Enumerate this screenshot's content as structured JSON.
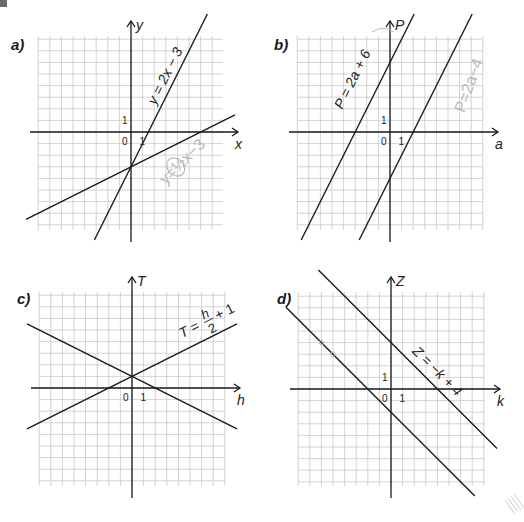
{
  "page": {
    "colors": {
      "grid": "#c8c8c8",
      "axis": "#1a1a1a",
      "line": "#1a1a1a",
      "pencil": "#b8b8b8"
    }
  },
  "panels": [
    {
      "id": "a",
      "label": "a)",
      "x_axis_label": "x",
      "y_axis_label": "y",
      "origin_label": "0",
      "x_unit_label": "1",
      "y_unit_label": "1",
      "origin_px": [
        131,
        132
      ],
      "grid_px": {
        "left": 38,
        "top": 36,
        "right": 223,
        "bottom": 230
      },
      "equation_label": "y = 2x − 3",
      "pencil_note": "y=½x−3",
      "lines": [
        {
          "name": "y = 2x − 3",
          "slope": 2,
          "intercept": -3,
          "labeled": true
        },
        {
          "name": "y = x/2 − 3",
          "slope": 0.5,
          "intercept": -3,
          "labeled": false
        }
      ]
    },
    {
      "id": "b",
      "label": "b)",
      "x_axis_label": "a",
      "y_axis_label": "P",
      "origin_label": "0",
      "x_unit_label": "1",
      "y_unit_label": "1",
      "origin_px": [
        390,
        132
      ],
      "grid_px": {
        "left": 297,
        "top": 36,
        "right": 483,
        "bottom": 230
      },
      "equation_label": "P = 2a + 6",
      "pencil_note": "P=2a−4",
      "lines": [
        {
          "name": "P = 2a + 6",
          "slope": 2,
          "intercept": 6,
          "labeled": true
        },
        {
          "name": "P = 2a − 4",
          "slope": 2,
          "intercept": -4,
          "labeled": false
        }
      ]
    },
    {
      "id": "c",
      "label": "c)",
      "x_axis_label": "h",
      "y_axis_label": "T",
      "origin_label": "0",
      "x_unit_label": "1",
      "y_unit_label": "",
      "origin_px": [
        132,
        388
      ],
      "grid_px": {
        "left": 39,
        "top": 292,
        "right": 225,
        "bottom": 486
      },
      "equation_label": "T = h/2 + 1",
      "lines": [
        {
          "name": "T = h/2 + 1",
          "slope": 0.5,
          "intercept": 1,
          "labeled": true
        },
        {
          "name": "T = −h/2 + 1",
          "slope": -0.5,
          "intercept": 1,
          "labeled": false
        }
      ]
    },
    {
      "id": "d",
      "label": "d)",
      "x_axis_label": "k",
      "y_axis_label": "Z",
      "origin_label": "0",
      "x_unit_label": "1",
      "y_unit_label": "1",
      "origin_px": [
        391,
        389
      ],
      "grid_px": {
        "left": 298,
        "top": 292,
        "right": 485,
        "bottom": 486
      },
      "equation_label": "Z = −k + 4",
      "lines": [
        {
          "name": "Z = −k + 4",
          "slope": -1,
          "intercept": 4,
          "labeled": true
        },
        {
          "name": "Z = −k − 2",
          "slope": -1,
          "intercept": -2,
          "labeled": false
        }
      ]
    }
  ],
  "cell_px": 11.6,
  "chart_data": [
    {
      "type": "line",
      "title": "a)",
      "xlabel": "x",
      "ylabel": "y",
      "grid": true,
      "xlim": [
        -8,
        8
      ],
      "ylim": [
        -8,
        8
      ],
      "series": [
        {
          "name": "y = 2x − 3",
          "x": [
            -2.5,
            5
          ],
          "values": [
            -8,
            7
          ]
        },
        {
          "name": "y = x/2 − 3",
          "x": [
            -8,
            8
          ],
          "values": [
            -7,
            1
          ]
        }
      ]
    },
    {
      "type": "line",
      "title": "b)",
      "xlabel": "a",
      "ylabel": "P",
      "grid": true,
      "xlim": [
        -8,
        8
      ],
      "ylim": [
        -8,
        8
      ],
      "series": [
        {
          "name": "P = 2a + 6",
          "x": [
            -7,
            1.3
          ],
          "values": [
            -8,
            8.6
          ]
        },
        {
          "name": "P = 2a − 4",
          "x": [
            -2,
            6
          ],
          "values": [
            -8,
            8
          ]
        }
      ]
    },
    {
      "type": "line",
      "title": "c)",
      "xlabel": "h",
      "ylabel": "T",
      "grid": true,
      "xlim": [
        -8,
        8
      ],
      "ylim": [
        -8,
        8
      ],
      "series": [
        {
          "name": "T = h/2 + 1",
          "x": [
            -8,
            8
          ],
          "values": [
            -3,
            5
          ]
        },
        {
          "name": "T = −h/2 + 1",
          "x": [
            -8,
            8
          ],
          "values": [
            5,
            -3
          ]
        }
      ]
    },
    {
      "type": "line",
      "title": "d)",
      "xlabel": "k",
      "ylabel": "Z",
      "grid": true,
      "xlim": [
        -8,
        8
      ],
      "ylim": [
        -8,
        8
      ],
      "series": [
        {
          "name": "Z = −k + 4",
          "x": [
            -4.8,
            8.5
          ],
          "values": [
            8.8,
            -4.5
          ]
        },
        {
          "name": "Z = −k − 2",
          "x": [
            -8.5,
            6.2
          ],
          "values": [
            6.5,
            -8.2
          ]
        }
      ]
    }
  ]
}
